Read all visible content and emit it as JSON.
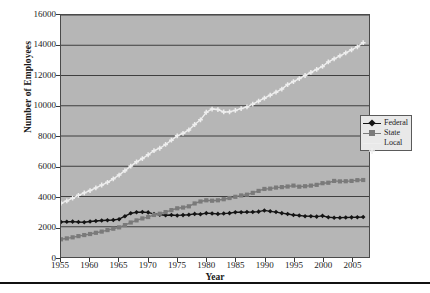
{
  "chart_data": {
    "type": "line",
    "title": "",
    "xlabel": "Year",
    "ylabel": "Number of Employees",
    "xlim": [
      1955,
      2008
    ],
    "ylim": [
      0,
      16000
    ],
    "grid": true,
    "legend_position": "right",
    "y_ticks": [
      0,
      2000,
      4000,
      6000,
      8000,
      10000,
      12000,
      14000,
      16000
    ],
    "y_tick_labels": [
      "0",
      "2000",
      "4000",
      "6000",
      "8000",
      "10000",
      "12000",
      "14000",
      "16000"
    ],
    "x_ticks": [
      1955,
      1960,
      1965,
      1970,
      1975,
      1980,
      1985,
      1990,
      1995,
      2000,
      2005
    ],
    "x_tick_labels": [
      "1955",
      "1960",
      "1965",
      "1970",
      "1975",
      "1980",
      "1985",
      "1990",
      "1995",
      "2000",
      "2005"
    ],
    "x": [
      1955,
      1956,
      1957,
      1958,
      1959,
      1960,
      1961,
      1962,
      1963,
      1964,
      1965,
      1966,
      1967,
      1968,
      1969,
      1970,
      1971,
      1972,
      1973,
      1974,
      1975,
      1976,
      1977,
      1978,
      1979,
      1980,
      1981,
      1982,
      1983,
      1984,
      1985,
      1986,
      1987,
      1988,
      1989,
      1990,
      1991,
      1992,
      1993,
      1994,
      1995,
      1996,
      1997,
      1998,
      1999,
      2000,
      2001,
      2002,
      2003,
      2004,
      2005,
      2006,
      2007
    ],
    "series": [
      {
        "name": "Federal",
        "color": "#141414",
        "marker": "diamond",
        "values": [
          2320,
          2330,
          2340,
          2310,
          2300,
          2350,
          2380,
          2410,
          2430,
          2450,
          2500,
          2700,
          2890,
          2960,
          2970,
          2950,
          2840,
          2790,
          2760,
          2780,
          2750,
          2770,
          2790,
          2850,
          2830,
          2900,
          2880,
          2850,
          2870,
          2900,
          2960,
          2960,
          2970,
          2980,
          3000,
          3080,
          3020,
          2970,
          2900,
          2840,
          2780,
          2740,
          2700,
          2690,
          2670,
          2720,
          2630,
          2600,
          2600,
          2610,
          2620,
          2630,
          2640
        ]
      },
      {
        "name": "State",
        "color": "#7a7a7a",
        "marker": "square",
        "values": [
          1170,
          1230,
          1300,
          1380,
          1450,
          1520,
          1600,
          1680,
          1780,
          1870,
          1960,
          2110,
          2280,
          2420,
          2550,
          2640,
          2780,
          2860,
          2970,
          3100,
          3220,
          3270,
          3350,
          3540,
          3670,
          3750,
          3720,
          3750,
          3820,
          3900,
          3980,
          4070,
          4120,
          4240,
          4370,
          4500,
          4520,
          4590,
          4620,
          4660,
          4720,
          4650,
          4680,
          4720,
          4770,
          4880,
          4910,
          5030,
          5000,
          5010,
          5030,
          5080,
          5090
        ]
      },
      {
        "name": "Local",
        "color": "#eeeeee",
        "marker": "plus",
        "values": [
          3560,
          3710,
          3890,
          4080,
          4240,
          4390,
          4570,
          4760,
          4940,
          5170,
          5420,
          5710,
          6010,
          6290,
          6510,
          6760,
          7030,
          7190,
          7440,
          7720,
          8010,
          8180,
          8400,
          8760,
          9070,
          9570,
          9780,
          9750,
          9590,
          9600,
          9690,
          9810,
          9920,
          10100,
          10300,
          10500,
          10700,
          10900,
          11100,
          11400,
          11600,
          11800,
          12000,
          12200,
          12400,
          12600,
          12900,
          13100,
          13300,
          13500,
          13700,
          13900,
          14170
        ]
      }
    ]
  },
  "legend": {
    "items": [
      {
        "label": "Federal"
      },
      {
        "label": "State"
      },
      {
        "label": "Local"
      }
    ]
  },
  "colors": {
    "plot_background": "#b6b6b6",
    "frame": "#4a4a4a",
    "gridline": "#3d3d3d",
    "federal": "#141414",
    "state": "#7a7a7a",
    "local": "#eeeeee",
    "legend_background": "#e9e9e9",
    "page_background": "#ffffff",
    "rule": "#111111"
  }
}
